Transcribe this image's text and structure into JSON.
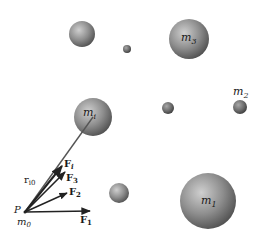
{
  "diagram": {
    "title": "",
    "origin": {
      "point_label": "P",
      "mass_label": "m",
      "mass_sub": "0"
    },
    "masses": [
      {
        "id": "sphere-a",
        "label": "",
        "sub": ""
      },
      {
        "id": "sphere-b",
        "label": "",
        "sub": ""
      },
      {
        "id": "m3",
        "label": "m",
        "sub": "3"
      },
      {
        "id": "mi",
        "label": "m",
        "sub": "i"
      },
      {
        "id": "sphere-c",
        "label": "",
        "sub": ""
      },
      {
        "id": "m2",
        "label": "m",
        "sub": "2"
      },
      {
        "id": "sphere-d",
        "label": "",
        "sub": ""
      },
      {
        "id": "m1",
        "label": "m",
        "sub": "1"
      }
    ],
    "vectors": {
      "r_io": {
        "label": "r",
        "sub": "i0"
      },
      "F_i": {
        "label": "F",
        "sub": "i"
      },
      "F_3": {
        "label": "F",
        "sub": "3"
      },
      "F_2": {
        "label": "F",
        "sub": "2"
      },
      "F_1": {
        "label": "F",
        "sub": "1"
      }
    },
    "colors": {
      "sphere": "#8a8a8a",
      "sphere_dark": "#4a4a4a",
      "sphere_light": "#d0d0d0",
      "vector": "#222222",
      "line": "#555555"
    }
  }
}
